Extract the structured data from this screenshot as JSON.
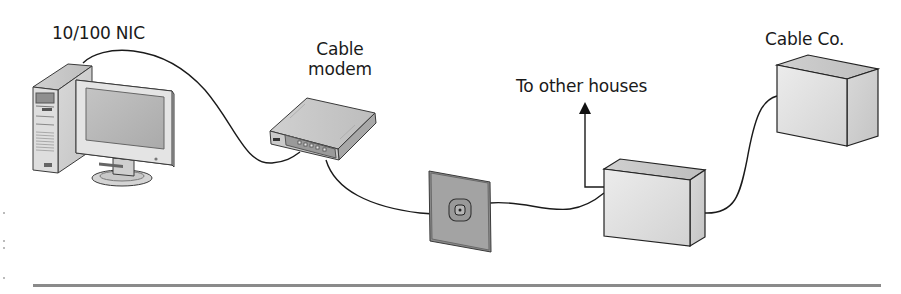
{
  "diagram": {
    "type": "network-topology",
    "labels": {
      "nic": "10/100 NIC",
      "modem_line1": "Cable",
      "modem_line2": "modem",
      "other_houses": "To other houses",
      "cable_co": "Cable Co."
    },
    "nodes": [
      {
        "id": "computer",
        "label": "10/100 NIC",
        "kind": "desktop-pc"
      },
      {
        "id": "cable-modem",
        "label": "Cable modem",
        "kind": "modem"
      },
      {
        "id": "wall-jack",
        "label": "",
        "kind": "coax-wall-outlet"
      },
      {
        "id": "splitter",
        "label": "",
        "kind": "junction-box"
      },
      {
        "id": "cable-co",
        "label": "Cable Co.",
        "kind": "headend-box"
      }
    ],
    "edges": [
      {
        "from": "computer",
        "to": "cable-modem"
      },
      {
        "from": "cable-modem",
        "to": "wall-jack"
      },
      {
        "from": "wall-jack",
        "to": "splitter"
      },
      {
        "from": "splitter",
        "to": "cable-co"
      },
      {
        "from": "splitter",
        "to": "other-houses",
        "arrow": true
      }
    ],
    "colors": {
      "line": "#1a1a1a",
      "box_light": "#e6e6e6",
      "box_mid": "#cfcfcf",
      "box_dark": "#b5b5b5",
      "wall_plate": "#9a9a9a",
      "rule": "#8a8a8a"
    }
  }
}
